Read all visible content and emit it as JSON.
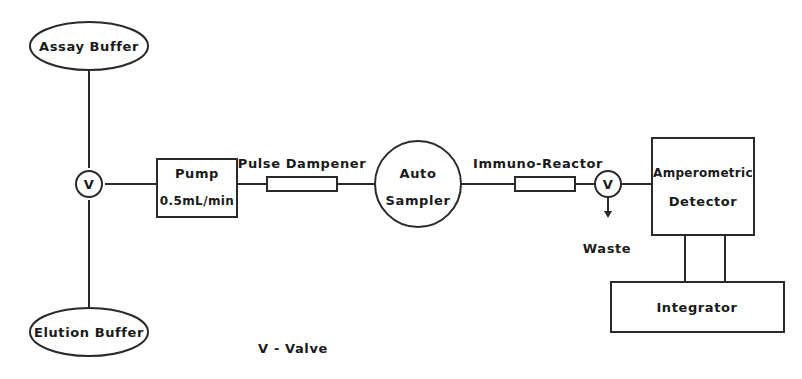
{
  "diagram": {
    "nodes": {
      "assay_buffer": {
        "label": "Assay Buffer",
        "shape": "ellipse"
      },
      "elution_buffer": {
        "label": "Elution Buffer",
        "shape": "ellipse"
      },
      "valve_1": {
        "label": "V",
        "shape": "circle"
      },
      "pump": {
        "label": "Pump",
        "rate": "0.5mL/min",
        "shape": "rectangle"
      },
      "pulse_dampener": {
        "label": "Pulse Dampener",
        "shape": "tube"
      },
      "auto_sampler": {
        "line1": "Auto",
        "line2": "Sampler",
        "shape": "circle"
      },
      "immuno_reactor": {
        "label": "Immuno-Reactor",
        "shape": "tube"
      },
      "valve_2": {
        "label": "V",
        "shape": "circle"
      },
      "waste": {
        "label": "Waste"
      },
      "detector": {
        "line1": "Amperometric",
        "line2": "Detector",
        "shape": "rectangle"
      },
      "integrator": {
        "label": "Integrator",
        "shape": "rectangle"
      }
    },
    "edges": [
      {
        "from": "assay_buffer",
        "to": "valve_1"
      },
      {
        "from": "elution_buffer",
        "to": "valve_1"
      },
      {
        "from": "valve_1",
        "to": "pump"
      },
      {
        "from": "pump",
        "to": "pulse_dampener"
      },
      {
        "from": "pulse_dampener",
        "to": "auto_sampler"
      },
      {
        "from": "auto_sampler",
        "to": "immuno_reactor"
      },
      {
        "from": "immuno_reactor",
        "to": "valve_2"
      },
      {
        "from": "valve_2",
        "to": "detector"
      },
      {
        "from": "valve_2",
        "to": "waste",
        "arrow": true
      },
      {
        "from": "detector",
        "to": "integrator",
        "double": true
      }
    ],
    "legend": "V - Valve"
  }
}
